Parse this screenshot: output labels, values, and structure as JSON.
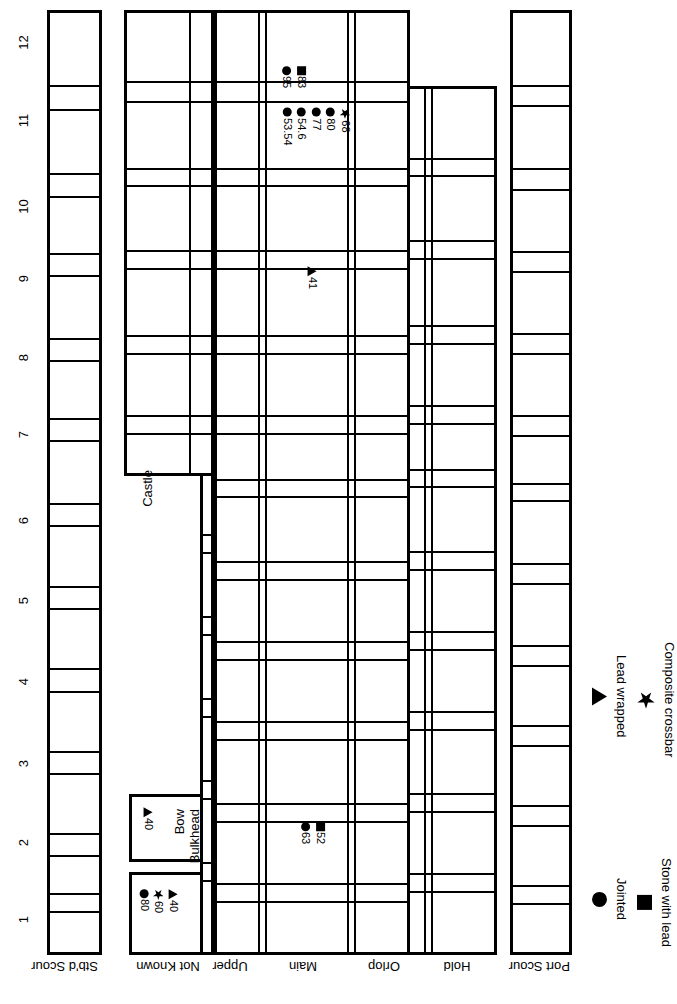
{
  "diagram": {
    "orientation": "rotated-90",
    "frame_axis": {
      "label": "",
      "ticks": [
        "1",
        "2",
        "3",
        "4",
        "5",
        "6",
        "7",
        "8",
        "9",
        "10",
        "11",
        "12"
      ]
    },
    "rows": [
      {
        "key": "stbd_scour",
        "label": "Stb'd Scour"
      },
      {
        "key": "not_known",
        "label": "Not Known"
      },
      {
        "key": "upper",
        "label": "Upper"
      },
      {
        "key": "main",
        "label": "Main"
      },
      {
        "key": "orlop",
        "label": "Orlop"
      },
      {
        "key": "hold",
        "label": "Hold"
      },
      {
        "key": "port_scour",
        "label": "Port Scour"
      }
    ],
    "annotations": [
      {
        "text": "Castle"
      },
      {
        "text": "Bow"
      },
      {
        "text": "Bulkhead"
      }
    ],
    "key_boxes": [
      {
        "name": "not-known-key",
        "markers": [
          {
            "symbol": "circle",
            "label": "80"
          },
          {
            "symbol": "star",
            "label": "60"
          },
          {
            "symbol": "tri",
            "label": "40"
          }
        ]
      },
      {
        "name": "bow-bulkhead-key",
        "title_lines": [
          "Bow",
          "Bulkhead"
        ],
        "markers": [
          {
            "symbol": "tri",
            "label": "40"
          }
        ]
      }
    ],
    "marker_groups": [
      {
        "name": "upper-deck-group-11-5",
        "markers": [
          {
            "symbol": "circle",
            "label": "95"
          },
          {
            "symbol": "square",
            "label": "83"
          }
        ]
      },
      {
        "name": "upper-deck-group-11",
        "markers": [
          {
            "symbol": "circle",
            "label": "53.54"
          },
          {
            "symbol": "circle",
            "label": "54.6"
          },
          {
            "symbol": "circle",
            "label": "77"
          },
          {
            "symbol": "circle",
            "label": "80"
          },
          {
            "symbol": "star",
            "label": "68"
          }
        ]
      },
      {
        "name": "main-deck-group-9",
        "markers": [
          {
            "symbol": "tri",
            "label": "41"
          }
        ]
      },
      {
        "name": "main-deck-group-2",
        "markers": [
          {
            "symbol": "circle",
            "label": "63"
          },
          {
            "symbol": "square",
            "label": "52"
          }
        ]
      }
    ],
    "legend": [
      {
        "symbol": "circle",
        "label": "Jointed"
      },
      {
        "symbol": "square",
        "label": "Stone with lead"
      },
      {
        "symbol": "tri",
        "label": "Lead wrapped"
      },
      {
        "symbol": "star",
        "label": "Composite crossbar"
      }
    ],
    "colors": {
      "ink": "#000000",
      "paper": "#ffffff"
    }
  }
}
